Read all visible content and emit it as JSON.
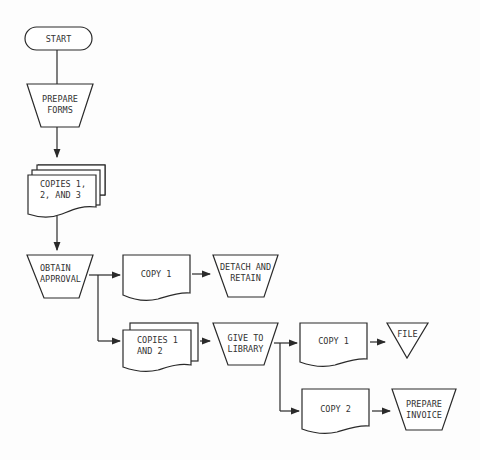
{
  "diagram": {
    "type": "document flowchart",
    "nodes": [
      {
        "id": "start",
        "shape": "terminal",
        "lines": [
          "START"
        ]
      },
      {
        "id": "prepare_forms",
        "shape": "manual-operation",
        "lines": [
          "PREPARE",
          "FORMS"
        ]
      },
      {
        "id": "copies_123",
        "shape": "multi-document",
        "lines": [
          "COPIES 1,",
          "2, AND 3"
        ]
      },
      {
        "id": "obtain_approval",
        "shape": "manual-operation",
        "lines": [
          "OBTAIN",
          "APPROVAL"
        ]
      },
      {
        "id": "copy1_a",
        "shape": "document",
        "lines": [
          "COPY 1"
        ]
      },
      {
        "id": "detach_retain",
        "shape": "manual-operation",
        "lines": [
          "DETACH AND",
          "RETAIN"
        ]
      },
      {
        "id": "copies_12",
        "shape": "multi-document",
        "lines": [
          "COPIES 1",
          "AND 2"
        ]
      },
      {
        "id": "give_library",
        "shape": "manual-operation",
        "lines": [
          "GIVE TO",
          "LIBRARY"
        ]
      },
      {
        "id": "copy1_b",
        "shape": "document",
        "lines": [
          "COPY 1"
        ]
      },
      {
        "id": "file",
        "shape": "offline-storage",
        "lines": [
          "FILE"
        ]
      },
      {
        "id": "copy2",
        "shape": "document",
        "lines": [
          "COPY 2"
        ]
      },
      {
        "id": "prepare_invoice",
        "shape": "manual-operation",
        "lines": [
          "PREPARE",
          "INVOICE"
        ]
      }
    ],
    "edges": [
      [
        "start",
        "prepare_forms"
      ],
      [
        "prepare_forms",
        "copies_123"
      ],
      [
        "copies_123",
        "obtain_approval"
      ],
      [
        "obtain_approval",
        "copy1_a"
      ],
      [
        "copy1_a",
        "detach_retain"
      ],
      [
        "obtain_approval",
        "copies_12"
      ],
      [
        "copies_12",
        "give_library"
      ],
      [
        "give_library",
        "copy1_b"
      ],
      [
        "copy1_b",
        "file"
      ],
      [
        "give_library",
        "copy2"
      ],
      [
        "copy2",
        "prepare_invoice"
      ]
    ]
  },
  "labels": {
    "start": "START",
    "prepare_forms": [
      "PREPARE",
      "FORMS"
    ],
    "copies_123": [
      "COPIES 1,",
      "2, AND 3"
    ],
    "obtain_approval": [
      "OBTAIN",
      "APPROVAL"
    ],
    "copy1_a": "COPY 1",
    "detach_retain": [
      "DETACH AND",
      "RETAIN"
    ],
    "copies_12": [
      "COPIES 1",
      "AND 2"
    ],
    "give_library": [
      "GIVE TO",
      "LIBRARY"
    ],
    "copy1_b": "COPY 1",
    "file": "FILE",
    "copy2": "COPY 2",
    "prepare_invoice": [
      "PREPARE",
      "INVOICE"
    ]
  }
}
